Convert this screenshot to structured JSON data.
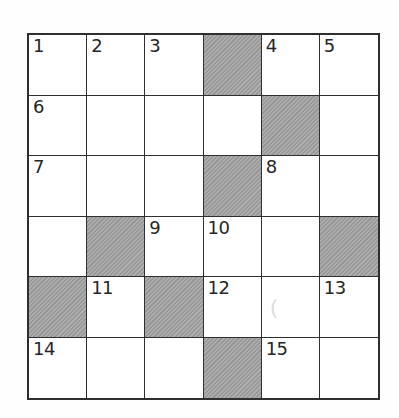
{
  "puzzle": {
    "type": "crossword-grid",
    "rows": 6,
    "cols": 6,
    "colors": {
      "line": "#2f2f2f",
      "cell_background": "#ffffff",
      "shaded_cell": "#a3a3a3",
      "page_background": "#fefefe",
      "number_text": "#262626"
    },
    "cells": [
      [
        {
          "number": "1"
        },
        {
          "number": "2"
        },
        {
          "number": "3"
        },
        {
          "shaded": true
        },
        {
          "number": "4"
        },
        {
          "number": "5"
        }
      ],
      [
        {
          "number": "6"
        },
        {},
        {},
        {},
        {
          "shaded": true
        },
        {}
      ],
      [
        {
          "number": "7"
        },
        {},
        {},
        {
          "shaded": true
        },
        {
          "number": "8"
        },
        {}
      ],
      [
        {},
        {
          "shaded": true
        },
        {
          "number": "9"
        },
        {
          "number": "10"
        },
        {},
        {
          "shaded": true
        }
      ],
      [
        {
          "shaded": true
        },
        {
          "number": "11"
        },
        {
          "shaded": true
        },
        {
          "number": "12"
        },
        {
          "faint_mark": "("
        },
        {
          "number": "13"
        }
      ],
      [
        {
          "number": "14"
        },
        {},
        {},
        {
          "shaded": true
        },
        {
          "number": "15"
        },
        {}
      ]
    ]
  }
}
